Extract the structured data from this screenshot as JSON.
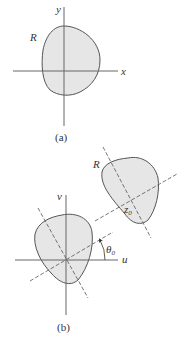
{
  "panel_a": {
    "region_label": "R",
    "x_axis_label": "x",
    "y_axis_label": "y",
    "caption": "(a)"
  },
  "panel_b": {
    "region_label": "R",
    "u_axis_label": "u",
    "v_axis_label": "v",
    "angle_label": "θ",
    "angle_subscript": "0",
    "point_label": "z",
    "point_subscript": "0",
    "caption": "(b)"
  },
  "colors": {
    "region_fill": "#e6e6e6",
    "stroke": "#555555"
  }
}
